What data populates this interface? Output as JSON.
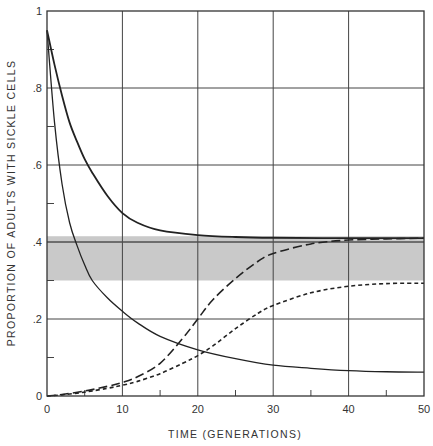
{
  "chart_data": {
    "type": "line",
    "title": "",
    "xlabel": "TIME (GENERATIONS)",
    "ylabel": "PROPORTION OF ADULTS WITH SICKLE CELLS",
    "xlim": [
      0,
      50
    ],
    "ylim": [
      0,
      1
    ],
    "grid": true,
    "legend": null,
    "x_ticks": [
      0,
      10,
      20,
      30,
      40,
      50
    ],
    "x_tick_labels": [
      "0",
      "10",
      "20",
      "30",
      "40",
      "50"
    ],
    "x_minor_ticks": [
      5,
      15,
      25,
      35,
      45
    ],
    "y_ticks": [
      0,
      0.2,
      0.4,
      0.6,
      0.8,
      1
    ],
    "y_tick_labels": [
      "0",
      ".2",
      ".4",
      ".6",
      ".8",
      "1"
    ],
    "y_minor_ticks": [
      0.1,
      0.3,
      0.5,
      0.7,
      0.9
    ],
    "shaded_band": {
      "y_low": 0.3,
      "y_high": 0.415,
      "color": "#c9c9c9",
      "x_range": [
        0,
        50
      ]
    },
    "reference_line": {
      "y": 0.4
    },
    "series": [
      {
        "name": "upper-solid",
        "style": "solid",
        "x": [
          0,
          1,
          2,
          3,
          4,
          5,
          6,
          8,
          10,
          12,
          15,
          20,
          25,
          30,
          40,
          50
        ],
        "values": [
          0.95,
          0.86,
          0.78,
          0.71,
          0.66,
          0.615,
          0.58,
          0.52,
          0.475,
          0.45,
          0.43,
          0.418,
          0.413,
          0.411,
          0.41,
          0.41
        ]
      },
      {
        "name": "lower-solid",
        "style": "solid",
        "x": [
          0,
          1,
          2,
          3,
          4,
          5,
          6,
          8,
          10,
          12,
          15,
          20,
          25,
          30,
          35,
          40,
          45,
          50
        ],
        "values": [
          0.95,
          0.71,
          0.55,
          0.45,
          0.39,
          0.34,
          0.3,
          0.255,
          0.22,
          0.19,
          0.155,
          0.12,
          0.097,
          0.08,
          0.072,
          0.066,
          0.063,
          0.062
        ]
      },
      {
        "name": "long-dashed",
        "style": "long-dash",
        "x": [
          0,
          2,
          5,
          8,
          10,
          12,
          15,
          18,
          20,
          22,
          25,
          28,
          30,
          35,
          40,
          45,
          50
        ],
        "values": [
          0,
          0.004,
          0.013,
          0.025,
          0.035,
          0.05,
          0.085,
          0.15,
          0.2,
          0.25,
          0.305,
          0.35,
          0.37,
          0.395,
          0.405,
          0.408,
          0.41
        ]
      },
      {
        "name": "short-dashed",
        "style": "short-dash",
        "x": [
          0,
          2,
          5,
          8,
          10,
          12,
          15,
          18,
          20,
          22,
          25,
          28,
          30,
          35,
          40,
          45,
          50
        ],
        "values": [
          0,
          0.003,
          0.01,
          0.02,
          0.028,
          0.038,
          0.058,
          0.085,
          0.105,
          0.13,
          0.175,
          0.215,
          0.235,
          0.268,
          0.285,
          0.292,
          0.293
        ]
      }
    ]
  }
}
